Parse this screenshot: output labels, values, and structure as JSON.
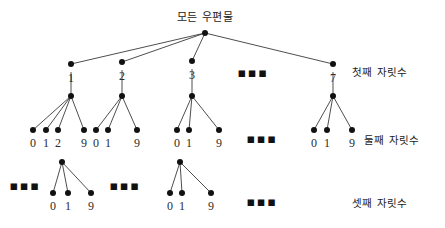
{
  "figure": {
    "type": "tree-diagram",
    "root": {
      "label": "모든 우편물",
      "x": 205,
      "y": 33
    },
    "level_labels": [
      {
        "id": "level-1",
        "text": "첫째 자릿수",
        "x": 352,
        "y": 66
      },
      {
        "id": "level-2",
        "text": "둘째 자릿수",
        "x": 364,
        "y": 134
      },
      {
        "id": "level-3",
        "text": "셋째 자릿수",
        "x": 352,
        "y": 197
      }
    ],
    "level1": {
      "nodes": [
        {
          "label": "1",
          "x": 71,
          "y": 64
        },
        {
          "label": "2",
          "x": 122,
          "y": 62
        },
        {
          "label": "3",
          "x": 192,
          "y": 61
        },
        {
          "label": "7",
          "x": 333,
          "y": 64
        }
      ],
      "ellipsis": [
        {
          "x": 253,
          "y": 72
        }
      ]
    },
    "level2": {
      "parents": [
        {
          "x": 71,
          "y": 96
        },
        {
          "x": 122,
          "y": 96
        },
        {
          "x": 192,
          "y": 96
        },
        {
          "x": 333,
          "y": 96
        }
      ],
      "groups": [
        {
          "parent_x": 71,
          "children": [
            {
              "label": "0",
              "x": 33
            },
            {
              "label": "1",
              "x": 46
            },
            {
              "label": "2",
              "x": 58
            },
            {
              "label": "9",
              "x": 84
            }
          ]
        },
        {
          "parent_x": 122,
          "children": [
            {
              "label": "0",
              "x": 96
            },
            {
              "label": "1",
              "x": 108
            },
            {
              "label": "9",
              "x": 137
            }
          ]
        },
        {
          "parent_x": 192,
          "children": [
            {
              "label": "0",
              "x": 177
            },
            {
              "label": "1",
              "x": 189
            },
            {
              "label": "9",
              "x": 219
            }
          ]
        },
        {
          "parent_x": 333,
          "children": [
            {
              "label": "0",
              "x": 314
            },
            {
              "label": "1",
              "x": 327
            },
            {
              "label": "9",
              "x": 352
            }
          ]
        }
      ],
      "child_y": 130,
      "label_y": 137,
      "ellipsis": [
        {
          "x": 262,
          "y": 138
        }
      ]
    },
    "level3": {
      "groups": [
        {
          "parent_x": 62,
          "parent_y": 162,
          "children": [
            {
              "label": "0",
              "x": 53
            },
            {
              "label": "1",
              "x": 68
            },
            {
              "label": "9",
              "x": 91
            }
          ]
        },
        {
          "parent_x": 180,
          "parent_y": 162,
          "children": [
            {
              "label": "0",
              "x": 170
            },
            {
              "label": "1",
              "x": 182
            },
            {
              "label": "9",
              "x": 211
            }
          ]
        }
      ],
      "child_y": 193,
      "label_y": 200,
      "ellipsis": [
        {
          "x": 25,
          "y": 185
        },
        {
          "x": 125,
          "y": 185
        },
        {
          "x": 262,
          "y": 201
        }
      ]
    },
    "colors": {
      "node": "#111111",
      "edge": "#3a3a3a",
      "text": "#1a1a1a",
      "background": "#ffffff"
    }
  }
}
